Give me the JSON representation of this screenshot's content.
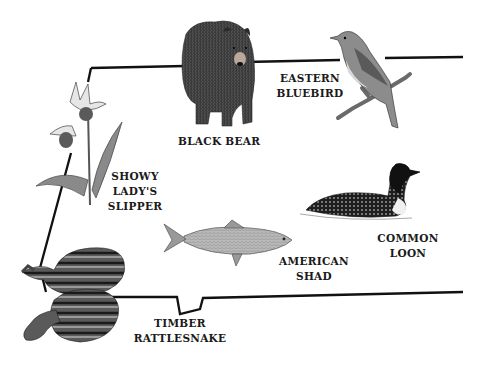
{
  "diagram": {
    "outline": {
      "stroke_color": "#111111",
      "description": "state outline"
    },
    "species": [
      {
        "id": "black-bear",
        "label_lines": [
          "BLACK BEAR"
        ],
        "kind": "mammal"
      },
      {
        "id": "eastern-bluebird",
        "label_lines": [
          "EASTERN",
          "BLUEBIRD"
        ],
        "kind": "bird"
      },
      {
        "id": "showy-ladys-slipper",
        "label_lines": [
          "SHOWY",
          "LADY'S",
          "SLIPPER"
        ],
        "kind": "flower"
      },
      {
        "id": "common-loon",
        "label_lines": [
          "COMMON",
          "LOON"
        ],
        "kind": "bird"
      },
      {
        "id": "american-shad",
        "label_lines": [
          "AMERICAN",
          "SHAD"
        ],
        "kind": "fish"
      },
      {
        "id": "timber-rattlesnake",
        "label_lines": [
          "TIMBER",
          "RATTLESNAKE"
        ],
        "kind": "reptile"
      }
    ]
  }
}
